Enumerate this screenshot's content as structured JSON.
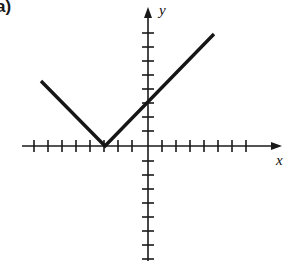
{
  "figure": {
    "part_label": "a)",
    "background_color": "#ffffff",
    "ink_color": "#1a1a1a",
    "width": 289,
    "height": 261
  },
  "axes": {
    "x_label": "x",
    "y_label": "y",
    "origin_px": {
      "x": 148,
      "y": 146
    },
    "unit_px": 14,
    "x_axis": {
      "start_px": 22,
      "arrow_tip_px": 282,
      "tick_positions_px": [
        34,
        48,
        62,
        76,
        90,
        104,
        118,
        132,
        162,
        176,
        190,
        204,
        218,
        232,
        246
      ],
      "tick_half_length_px": 6,
      "tick_values": [
        -8,
        -7,
        -6,
        -5,
        -4,
        -3,
        -2,
        -1,
        1,
        2,
        3,
        4,
        5,
        6,
        7
      ]
    },
    "y_axis": {
      "arrow_tip_px": 7,
      "end_px": 261,
      "tick_positions_px": [
        33,
        47,
        61,
        75,
        89,
        103,
        117,
        131,
        161,
        175,
        189,
        203,
        217,
        231,
        245,
        259
      ],
      "tick_half_length_px": 6,
      "tick_values": [
        8,
        7,
        6,
        5,
        4,
        3,
        2,
        1,
        -1,
        -2,
        -3,
        -4,
        -5,
        -6,
        -7,
        -8
      ]
    },
    "axis_line_width_px": 1.6,
    "arrow_head_width_px": 8,
    "arrow_head_length_px": 11
  },
  "chart_data": {
    "type": "line",
    "title": "",
    "xlabel": "x",
    "ylabel": "y",
    "grid": false,
    "legend": "none",
    "xlim": [
      -9,
      9.6
    ],
    "ylim": [
      -8.2,
      9.9
    ],
    "series": [
      {
        "name": "y = |x + 3|",
        "values_px": [
          {
            "x": 41,
            "y": 81
          },
          {
            "x": 105,
            "y": 146
          },
          {
            "x": 214,
            "y": 34
          }
        ],
        "points": [
          {
            "x": -7.6,
            "y": 4.6
          },
          {
            "x": -3.0,
            "y": 0.0
          },
          {
            "x": 4.7,
            "y": 8.0
          }
        ],
        "vertex": {
          "x": -3,
          "y": 0
        },
        "left_slope": -1,
        "right_slope": 1,
        "y_intercept": 3.3,
        "line_width_px": 3.4,
        "color": "#161616"
      }
    ]
  }
}
